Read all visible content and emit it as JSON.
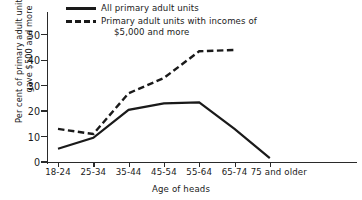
{
  "chart_data": {
    "type": "line",
    "title": "",
    "xlabel": "Age of heads",
    "ylabel": "Per cent of primary adult units who gave $500 and more",
    "ylabel_line1": "Per cent of primary adult units who",
    "ylabel_line2": "gave $500 and more",
    "categories": [
      "18-24",
      "25-34",
      "35-44",
      "45-54",
      "55-64",
      "65-74",
      "75 and older"
    ],
    "ylim": [
      0,
      55
    ],
    "yticks": [
      0,
      10,
      20,
      30,
      40,
      50
    ],
    "xlim_note": "categorical, evenly spaced",
    "grid": false,
    "legend_position": "top",
    "series": [
      {
        "name": "All primary adult units",
        "style": "solid",
        "color": "#1a1a1a",
        "values": [
          5.2,
          9.5,
          20.5,
          23.0,
          23.4,
          13.0,
          1.5
        ]
      },
      {
        "name": "Primary adult units with incomes of $5,000 and more",
        "style": "dashed",
        "color": "#1a1a1a",
        "values": [
          13.0,
          11.0,
          27.0,
          33.0,
          43.5,
          44.0,
          null
        ]
      }
    ]
  },
  "legend": {
    "entries": [
      {
        "label": "All primary adult units",
        "label_line2": "",
        "style": "solid"
      },
      {
        "label": "Primary adult units with incomes of",
        "label_line2": "$5,000 and more",
        "style": "dashed"
      }
    ]
  },
  "axes": {
    "x_title": "Age of heads",
    "y_tick_labels": [
      "0",
      "10",
      "20",
      "30",
      "40",
      "50"
    ],
    "x_tick_labels": [
      "18-24",
      "25-34",
      "35-44",
      "45-54",
      "55-64",
      "65-74",
      "75 and older"
    ]
  }
}
